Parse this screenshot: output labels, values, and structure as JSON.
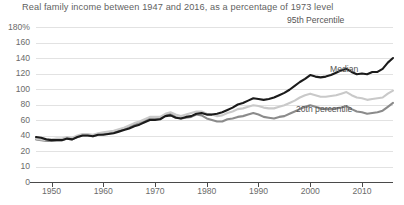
{
  "chart_data": {
    "type": "line",
    "title": "Real family income  between 1947 and 2016, as a percentage of 1973 level",
    "xlabel": "",
    "ylabel": "",
    "grid": true,
    "legend_position": "inline-right",
    "xlim": [
      1947,
      2016
    ],
    "ylim": [
      0,
      180
    ],
    "yticks": [
      180,
      160,
      140,
      120,
      100,
      80,
      60,
      40,
      20,
      10,
      0
    ],
    "ytick_labels": [
      "180%",
      "160",
      "140",
      "120",
      "100",
      "80",
      "60",
      "40",
      "20",
      "10",
      "0"
    ],
    "xticks": [
      1950,
      1960,
      1970,
      1980,
      1990,
      2000,
      2010
    ],
    "xtick_labels": [
      "1950",
      "1960",
      "1970",
      "1980",
      "1990",
      "2000",
      "2010"
    ],
    "x": [
      1947,
      1948,
      1949,
      1950,
      1951,
      1952,
      1953,
      1954,
      1955,
      1956,
      1957,
      1958,
      1959,
      1960,
      1961,
      1962,
      1963,
      1964,
      1965,
      1966,
      1967,
      1968,
      1969,
      1970,
      1971,
      1972,
      1973,
      1974,
      1975,
      1976,
      1977,
      1978,
      1979,
      1980,
      1981,
      1982,
      1983,
      1984,
      1985,
      1986,
      1987,
      1988,
      1989,
      1990,
      1991,
      1992,
      1993,
      1994,
      1995,
      1996,
      1997,
      1998,
      1999,
      2000,
      2001,
      2002,
      2003,
      2004,
      2005,
      2006,
      2007,
      2008,
      2009,
      2010,
      2011,
      2012,
      2013,
      2014,
      2015,
      2016
    ],
    "series": [
      {
        "name": "95th Percentile",
        "color": "#1b1b1b",
        "values": [
          38,
          37,
          35,
          34,
          34,
          34,
          36,
          35,
          38,
          40,
          40,
          39,
          41,
          41,
          42,
          43,
          45,
          47,
          49,
          52,
          54,
          57,
          60,
          60,
          61,
          65,
          66,
          63,
          62,
          64,
          65,
          68,
          69,
          67,
          67,
          68,
          70,
          73,
          76,
          80,
          82,
          85,
          88,
          87,
          86,
          87,
          89,
          92,
          95,
          99,
          104,
          109,
          113,
          118,
          116,
          115,
          116,
          118,
          121,
          124,
          126,
          122,
          119,
          120,
          119,
          122,
          122,
          126,
          134,
          140
        ]
      },
      {
        "name": "Median",
        "color": "#c9c9c9",
        "values": [
          36,
          35,
          34,
          35,
          36,
          36,
          38,
          37,
          40,
          42,
          42,
          41,
          43,
          44,
          45,
          46,
          48,
          50,
          53,
          56,
          58,
          61,
          64,
          64,
          64,
          68,
          70,
          67,
          65,
          67,
          69,
          71,
          71,
          68,
          67,
          65,
          66,
          69,
          71,
          74,
          75,
          77,
          79,
          78,
          76,
          75,
          75,
          77,
          79,
          82,
          85,
          89,
          92,
          94,
          92,
          90,
          90,
          91,
          92,
          94,
          96,
          92,
          89,
          88,
          86,
          87,
          88,
          89,
          94,
          98
        ]
      },
      {
        "name": "20th percentile",
        "color": "#8b8b8b",
        "values": [
          35,
          34,
          33,
          33,
          34,
          34,
          36,
          35,
          38,
          40,
          40,
          39,
          41,
          42,
          43,
          44,
          46,
          48,
          51,
          54,
          56,
          59,
          62,
          62,
          62,
          66,
          68,
          64,
          62,
          63,
          64,
          67,
          66,
          62,
          60,
          58,
          58,
          61,
          62,
          64,
          65,
          67,
          69,
          67,
          64,
          63,
          62,
          64,
          65,
          68,
          71,
          74,
          77,
          79,
          77,
          75,
          74,
          74,
          75,
          76,
          78,
          74,
          71,
          70,
          68,
          69,
          70,
          72,
          77,
          82
        ]
      }
    ],
    "annotations": [
      {
        "text": "95th Percentile",
        "series": "95th Percentile"
      },
      {
        "text": "Median",
        "series": "Median"
      },
      {
        "text": "20th percentile",
        "series": "20th percentile"
      }
    ]
  }
}
